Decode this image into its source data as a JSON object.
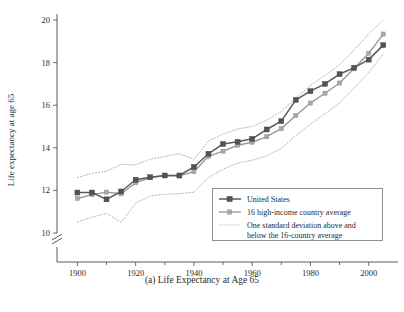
{
  "figure": {
    "caption": "(a) Life Expectancy at Age 65",
    "ylabel": "Life expectancy at age 65"
  },
  "legend": {
    "items": [
      {
        "label": "United States",
        "marker": "square-dark",
        "color": "#555b66"
      },
      {
        "label": "16 high-income country average",
        "marker": "square-gray",
        "color": "#9a9a9a"
      },
      {
        "label": "One standard deviation above and",
        "marker": "dotted",
        "color": "#a6a6a6"
      },
      {
        "label": "below the 16-country average",
        "marker": "none",
        "color": "#a6a6a6"
      }
    ]
  },
  "axes": {
    "y_ticks": [
      "10",
      "12",
      "14",
      "16",
      "18",
      "20"
    ],
    "x_ticks": [
      "1900",
      "1920",
      "1940",
      "1960",
      "1980",
      "2000"
    ],
    "x_minor_ticks": [
      "1910",
      "1930",
      "1950",
      "1970",
      "1990"
    ],
    "axis_break": true
  },
  "chart_data": {
    "type": "line",
    "title": "(a) Life Expectancy at Age 65",
    "xlabel": "",
    "ylabel": "Life expectancy at age 65",
    "xlim": [
      1893,
      2008
    ],
    "ylim": [
      9.4,
      20.2
    ],
    "grid": false,
    "legend_position": "bottom-right",
    "axis_break_below": 10,
    "x": [
      1900,
      1905,
      1910,
      1915,
      1920,
      1925,
      1930,
      1935,
      1940,
      1945,
      1950,
      1955,
      1960,
      1965,
      1970,
      1975,
      1980,
      1985,
      1990,
      1995,
      2000,
      2005
    ],
    "series": [
      {
        "name": "United States",
        "marker": "square",
        "color": "#555b66",
        "style": "solid",
        "values": [
          11.9,
          11.9,
          11.58,
          11.95,
          12.5,
          12.62,
          12.7,
          12.7,
          13.1,
          13.72,
          14.18,
          14.28,
          14.42,
          14.86,
          15.25,
          16.25,
          16.66,
          17.0,
          17.46,
          17.76,
          18.14,
          18.82
        ]
      },
      {
        "name": "16 high-income country average",
        "marker": "square-small",
        "color": "#9a9a9a",
        "style": "solid",
        "values": [
          11.62,
          11.8,
          11.92,
          11.84,
          12.36,
          12.6,
          12.7,
          12.68,
          12.88,
          13.6,
          13.84,
          14.12,
          14.26,
          14.52,
          14.9,
          15.52,
          16.1,
          16.56,
          17.04,
          17.72,
          18.44,
          19.34
        ]
      },
      {
        "name": "One standard deviation above the 16-country average",
        "marker": "none",
        "color": "#a6a6a6",
        "style": "dotted",
        "values": [
          12.6,
          12.8,
          12.9,
          13.22,
          13.2,
          13.46,
          13.6,
          13.72,
          13.46,
          14.32,
          14.64,
          14.88,
          15.0,
          15.3,
          15.7,
          16.34,
          16.92,
          17.4,
          17.9,
          18.6,
          19.34,
          20.0
        ]
      },
      {
        "name": "One standard deviation below the 16-country average",
        "marker": "none",
        "color": "#a6a6a6",
        "style": "dotted",
        "values": [
          10.52,
          10.74,
          10.92,
          10.5,
          11.4,
          11.74,
          11.82,
          11.84,
          11.92,
          12.6,
          13.0,
          13.28,
          13.42,
          13.62,
          13.98,
          14.58,
          15.1,
          15.6,
          16.1,
          16.8,
          17.54,
          18.4
        ]
      }
    ]
  }
}
